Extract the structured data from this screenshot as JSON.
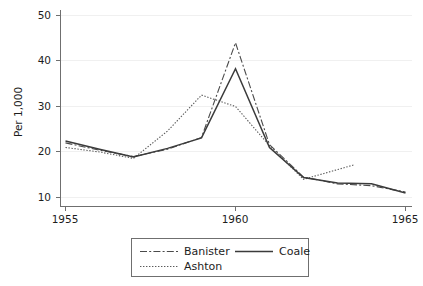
{
  "chart_data": {
    "type": "line",
    "title": "",
    "xlabel": "",
    "ylabel": "Per 1,000",
    "xlim": [
      1955,
      1965
    ],
    "ylim": [
      8,
      52
    ],
    "xticks": [
      1955,
      1960,
      1965
    ],
    "yticks": [
      10,
      20,
      30,
      40,
      50
    ],
    "xtick_labels": [
      "1955",
      "1960",
      "1965"
    ],
    "ytick_labels": [
      "10",
      "20",
      "30",
      "40",
      "50"
    ],
    "grid": "faint-horizontal",
    "legend_position": "below-center",
    "series": [
      {
        "name": "Banister",
        "style": "dash-dot",
        "color": "#4a4a4a",
        "x": [
          1955,
          1956,
          1957,
          1958,
          1959,
          1960,
          1961,
          1962,
          1963,
          1964,
          1965
        ],
        "values": [
          22.0,
          20.4,
          19.0,
          20.6,
          23.2,
          44.0,
          21.6,
          14.5,
          13.0,
          12.6,
          11.2
        ]
      },
      {
        "name": "Coale",
        "style": "solid",
        "color": "#3b3b3b",
        "x": [
          1955,
          1956,
          1957,
          1958,
          1959,
          1960,
          1961,
          1962,
          1963,
          1964,
          1965
        ],
        "values": [
          22.4,
          20.6,
          18.9,
          20.8,
          23.1,
          38.3,
          21.0,
          14.4,
          13.2,
          13.0,
          11.0
        ]
      },
      {
        "name": "Ashton",
        "style": "dotted",
        "color": "#5a5a5a",
        "x": [
          1955,
          1956,
          1957,
          1958,
          1959,
          1960,
          1961,
          1962,
          1963.5
        ],
        "values": [
          21.0,
          20.0,
          18.6,
          24.6,
          32.5,
          30.0,
          21.4,
          14.0,
          17.2
        ]
      }
    ]
  },
  "legend": {
    "entries": [
      {
        "label": "Banister",
        "style": "dash-dot"
      },
      {
        "label": "Coale",
        "style": "solid"
      },
      {
        "label": "Ashton",
        "style": "dotted"
      }
    ]
  },
  "axis": {
    "y_title": "Per 1,000"
  }
}
